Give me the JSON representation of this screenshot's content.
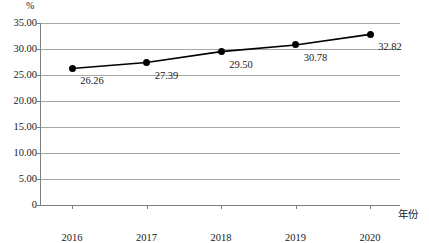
{
  "chart_data": {
    "type": "line",
    "title": "",
    "subtitle": "",
    "xlabel": "年份",
    "ylabel": "%",
    "categories": [
      "2016",
      "2017",
      "2018",
      "2019",
      "2020"
    ],
    "x": [
      2016,
      2017,
      2018,
      2019,
      2020
    ],
    "values": [
      26.26,
      27.39,
      29.5,
      30.78,
      32.82
    ],
    "point_labels": [
      "26.26",
      "27.39",
      "29.50",
      "30.78",
      "32.82"
    ],
    "series": [
      {
        "name": "",
        "values": [
          26.26,
          27.39,
          29.5,
          30.78,
          32.82
        ],
        "color": "#000000",
        "marker": "circle"
      }
    ],
    "ylim": [
      0,
      35
    ],
    "ytick_values": [
      0,
      5,
      10,
      15,
      20,
      25,
      30,
      35
    ],
    "ytick_labels": [
      "0",
      "5.00",
      "10.00",
      "15.00",
      "20.00",
      "25.00",
      "30.00",
      "35.00"
    ],
    "xtick_labels": [
      "2016",
      "2017",
      "2018",
      "2019",
      "2020"
    ],
    "grid": "horizontal",
    "legend": "none",
    "gridline_color": "#a6a6a6",
    "axis_color": "#7f7f7f",
    "line_color": "#000000",
    "background": "#ffffff"
  }
}
